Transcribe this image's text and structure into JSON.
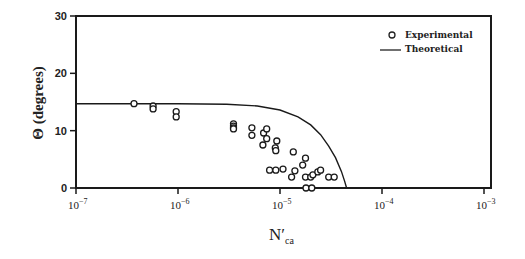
{
  "chart_data": {
    "type": "scatter",
    "title": "",
    "xlabel": "N'ca",
    "xlabel_main": "N′",
    "xlabel_sub": "ca",
    "ylabel": "Θ (degrees)",
    "xscale": "log",
    "xlim": [
      1e-07,
      0.001
    ],
    "ylim": [
      0,
      30
    ],
    "x_ticks": [
      1e-07,
      1e-06,
      1e-05,
      0.0001,
      0.001
    ],
    "x_tick_labels": [
      {
        "base": "10",
        "exp": "−7"
      },
      {
        "base": "10",
        "exp": "−6"
      },
      {
        "base": "10",
        "exp": "−5"
      },
      {
        "base": "10",
        "exp": "−4"
      },
      {
        "base": "10",
        "exp": "−3"
      }
    ],
    "y_ticks": [
      0,
      10,
      20,
      30
    ],
    "y_tick_labels": [
      "0",
      "10",
      "20",
      "30"
    ],
    "grid": false,
    "legend_position": "upper right",
    "legend": [
      {
        "label": "Experimental",
        "marker": "open-circle"
      },
      {
        "label": "Theoretical",
        "marker": "line"
      }
    ],
    "series": [
      {
        "name": "Experimental",
        "type": "scatter",
        "points": [
          [
            3.7e-07,
            14.7
          ],
          [
            5.7e-07,
            14.3
          ],
          [
            5.7e-07,
            13.8
          ],
          [
            9.6e-07,
            13.3
          ],
          [
            9.6e-07,
            12.4
          ],
          [
            3.5e-06,
            11.2
          ],
          [
            3.5e-06,
            10.8
          ],
          [
            3.5e-06,
            10.5
          ],
          [
            3.5e-06,
            10.3
          ],
          [
            5.3e-06,
            10.5
          ],
          [
            5.3e-06,
            9.2
          ],
          [
            6.9e-06,
            9.6
          ],
          [
            7.4e-06,
            10.3
          ],
          [
            7.4e-06,
            8.6
          ],
          [
            6.8e-06,
            7.5
          ],
          [
            9.3e-06,
            8.2
          ],
          [
            9e-06,
            7.0
          ],
          [
            9.1e-06,
            6.5
          ],
          [
            1.35e-05,
            6.3
          ],
          [
            1.78e-05,
            5.2
          ],
          [
            7.9e-06,
            3.1
          ],
          [
            9.1e-06,
            3.1
          ],
          [
            1.07e-05,
            3.3
          ],
          [
            1.4e-05,
            3.0
          ],
          [
            1.3e-05,
            1.9
          ],
          [
            1.67e-05,
            4.0
          ],
          [
            1.78e-05,
            1.9
          ],
          [
            2e-05,
            1.9
          ],
          [
            2.1e-05,
            2.3
          ],
          [
            2.35e-05,
            2.8
          ],
          [
            2.5e-05,
            3.1
          ],
          [
            3e-05,
            1.9
          ],
          [
            3.4e-05,
            1.9
          ],
          [
            1.8e-05,
            0.0
          ],
          [
            2.05e-05,
            0.0
          ]
        ]
      },
      {
        "name": "Theoretical",
        "type": "line",
        "points": [
          [
            1e-07,
            14.7
          ],
          [
            1e-06,
            14.7
          ],
          [
            3e-06,
            14.6
          ],
          [
            6e-06,
            14.3
          ],
          [
            1e-05,
            13.6
          ],
          [
            1.5e-05,
            12.4
          ],
          [
            2e-05,
            11.0
          ],
          [
            2.5e-05,
            9.3
          ],
          [
            3e-05,
            7.3
          ],
          [
            3.5e-05,
            5.3
          ],
          [
            4e-05,
            2.9
          ],
          [
            4.3e-05,
            1.2
          ],
          [
            4.5e-05,
            0.0
          ]
        ]
      }
    ]
  }
}
